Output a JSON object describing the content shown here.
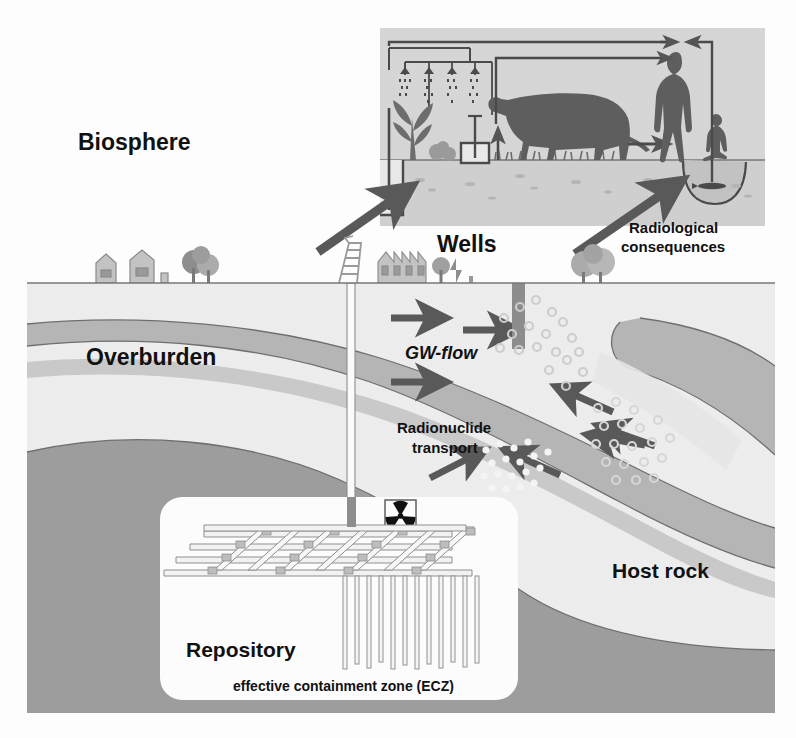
{
  "diagram": {
    "title_labels": {
      "biosphere": "Biosphere",
      "overburden": "Overburden",
      "host_rock": "Host rock",
      "repository": "Repository",
      "wells": "Wells",
      "gw_flow": "GW-flow",
      "radionuclide_transport_line1": "Radionuclide",
      "radionuclide_transport_line2": "transport",
      "radiological_line1": "Radiological",
      "radiological_line2": "consequences",
      "ecz": "effective containment zone (ECZ)"
    },
    "colors": {
      "biosphere_panel": "#d9d9d9",
      "surface_layer": "#eaeaea",
      "aquifer_band": "#b8b8b8",
      "host_rock": "#9b9b9b",
      "repository_box": "#fcfcfc",
      "arrow": "#595959",
      "page_background": "#fdfdfd",
      "outline": "#555555",
      "text": "#111111"
    },
    "icons": {
      "radiation_trefoil": "radiation-trefoil-icon",
      "drill_rig": "drill-rig-icon",
      "human": "human-silhouette-icon",
      "child": "child-silhouette-icon",
      "cow": "cow-silhouette-icon",
      "fish": "fish-icon",
      "plant": "plant-icon",
      "houses": "houses-icon",
      "factory": "factory-icon",
      "trees": "trees-icon",
      "well": "well-icon",
      "rain": "rain-icon"
    },
    "flow_arrows": {
      "gw_flow_count": 3,
      "recharge_count": 2,
      "uptake_count": 1,
      "well_up_count": 1,
      "biosphere_in_count": 2
    }
  }
}
